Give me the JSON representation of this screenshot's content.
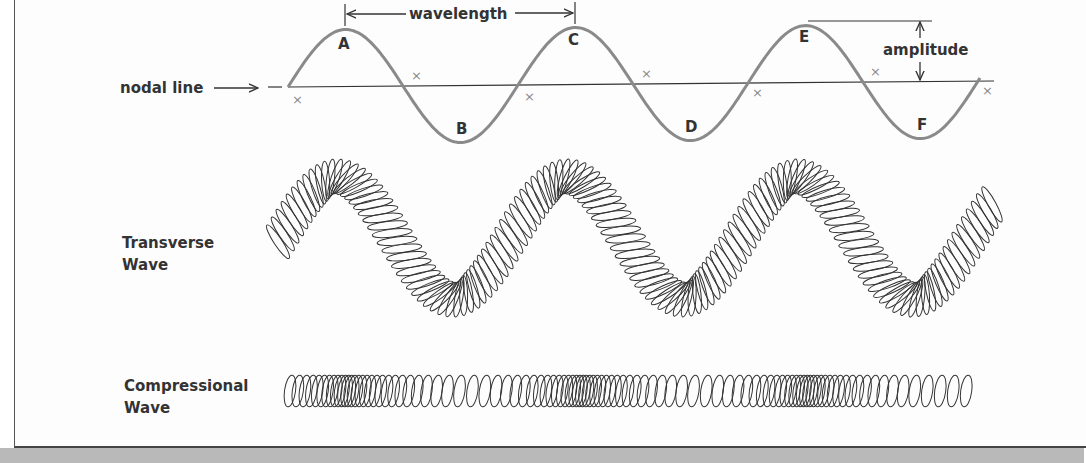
{
  "figure": {
    "background": "#fdfdfd",
    "caption_strip_color": "#b9b9b9",
    "wave_color": "#8a8a8a",
    "line_color": "#333333",
    "coil_color": "#333333"
  },
  "top_diagram": {
    "nodal_line_label": "nodal line",
    "wavelength_label": "wavelength",
    "amplitude_label": "amplitude",
    "point_labels": [
      "A",
      "B",
      "C",
      "D",
      "E",
      "F"
    ],
    "node_marker": "×",
    "node_count": 8
  },
  "transverse": {
    "label_line1": "Transverse",
    "label_line2": "Wave"
  },
  "compressional": {
    "label_line1": "Compressional",
    "label_line2": "Wave"
  },
  "chart_data": {
    "type": "diagram",
    "annotations": [
      "nodal line",
      "wavelength",
      "amplitude",
      "A",
      "B",
      "C",
      "D",
      "E",
      "F"
    ],
    "sine_wave": {
      "crests": [
        "A",
        "C",
        "E"
      ],
      "troughs": [
        "B",
        "D",
        "F"
      ],
      "cycles": 3,
      "wavelength_marked_between": [
        "A",
        "C"
      ],
      "amplitude_marked_at": "E"
    },
    "panels": [
      "Transverse Wave (spring coil)",
      "Compressional Wave (spring coil)"
    ]
  }
}
